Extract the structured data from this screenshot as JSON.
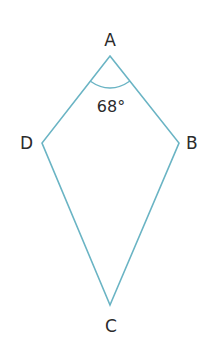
{
  "diagram": {
    "type": "kite",
    "stroke_color": "#6ab4c4",
    "text_color": "#2b2b2b",
    "vertices": {
      "A": {
        "label": "A",
        "x": 110,
        "y": 56
      },
      "B": {
        "label": "B",
        "x": 179,
        "y": 143
      },
      "C": {
        "label": "C",
        "x": 110,
        "y": 305
      },
      "D": {
        "label": "D",
        "x": 42,
        "y": 143
      }
    },
    "angle_A": {
      "label": "68°",
      "value": 68
    }
  }
}
